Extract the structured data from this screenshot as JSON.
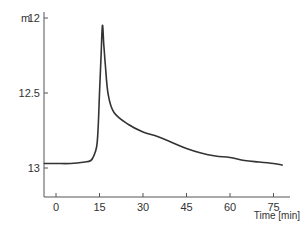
{
  "chart_data": {
    "type": "line",
    "title": "",
    "xlabel": "Time [min]",
    "ylabel": "m",
    "xlim": [
      -4,
      80
    ],
    "ylim": [
      13,
      12
    ],
    "y_inverted": true,
    "grid": false,
    "legend": null,
    "x_ticks": [
      0,
      15,
      30,
      45,
      60,
      75
    ],
    "x_tick_labels": [
      "0",
      "15",
      "30",
      "45",
      "60",
      "75"
    ],
    "y_ticks": [
      12,
      12.5,
      13
    ],
    "y_tick_labels": [
      "12",
      "12.5",
      "13"
    ],
    "series": [
      {
        "name": "level",
        "color": "#333333",
        "x": [
          -4,
          0,
          5,
          10,
          12,
          13,
          14,
          14.5,
          15,
          15.5,
          16,
          16.5,
          17,
          18,
          20,
          25,
          30,
          35,
          40,
          45,
          50,
          55,
          60,
          65,
          70,
          75,
          78
        ],
        "y": [
          12.97,
          12.97,
          12.97,
          12.96,
          12.95,
          12.92,
          12.86,
          12.75,
          12.5,
          12.28,
          12.05,
          12.18,
          12.31,
          12.51,
          12.63,
          12.71,
          12.76,
          12.79,
          12.83,
          12.87,
          12.9,
          12.92,
          12.93,
          12.95,
          12.96,
          12.97,
          12.98
        ]
      }
    ]
  },
  "labels": {
    "ylabel": "m",
    "xlabel": "Time [min]"
  }
}
